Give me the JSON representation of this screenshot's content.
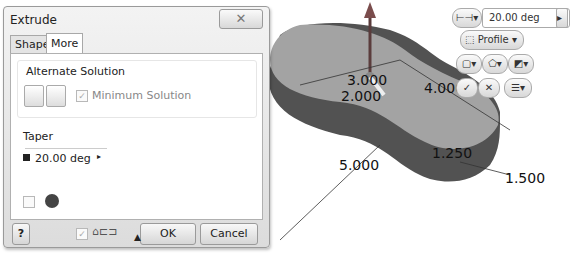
{
  "dialog": {
    "title": "Extrude",
    "close_icon": "close-icon",
    "tabs": [
      {
        "label": "Shape",
        "active": false
      },
      {
        "label": "More",
        "active": true
      }
    ],
    "alternate_solution": {
      "label": "Alternate Solution",
      "buttons": [
        "alternate-solution-1-icon",
        "alternate-solution-2-icon"
      ],
      "minimum_solution_label": "Minimum Solution",
      "minimum_solution_checked": true
    },
    "taper": {
      "label": "Taper",
      "value": "20.00 deg"
    },
    "footer": {
      "help_icon": "?",
      "ok_label": "OK",
      "cancel_label": "Cancel",
      "expand_icon": "▲"
    }
  },
  "mini_toolbar": {
    "distance_value": "20.00 deg",
    "profile_label": "Profile",
    "ok_glyph": "✓",
    "cancel_glyph": "✕"
  },
  "viewport": {
    "dimensions": [
      "3.000",
      "2.000",
      "4.000",
      "5.000",
      "1.250",
      "1.500"
    ]
  },
  "colors": {
    "dialog_bg": "#e4e4e4",
    "panel_bg": "#ffffff",
    "part_top": "#9a9a9a",
    "part_side": "#505050"
  }
}
